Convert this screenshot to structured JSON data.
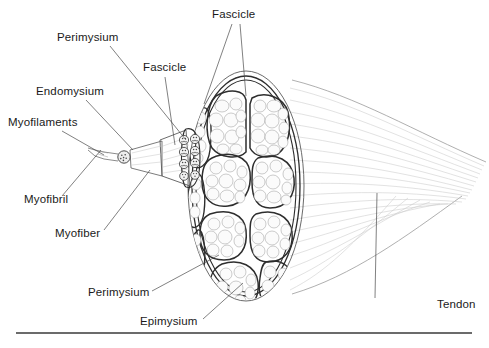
{
  "figure": {
    "width": 489,
    "height": 348,
    "background_color": "#ffffff"
  },
  "labels": [
    {
      "id": "fascicle-top",
      "text": "Fascicle",
      "x": 212,
      "y": 18,
      "anchor": "start"
    },
    {
      "id": "perimysium-top",
      "text": "Perimysium",
      "x": 57,
      "y": 41,
      "anchor": "start"
    },
    {
      "id": "fascicle-mid",
      "text": "Fascicle",
      "x": 143,
      "y": 71,
      "anchor": "start"
    },
    {
      "id": "endomysium",
      "text": "Endomysium",
      "x": 36,
      "y": 95,
      "anchor": "start"
    },
    {
      "id": "myofilaments",
      "text": "Myofilaments",
      "x": 8,
      "y": 126,
      "anchor": "start"
    },
    {
      "id": "myofibril",
      "text": "Myofibril",
      "x": 24,
      "y": 203,
      "anchor": "start"
    },
    {
      "id": "myofiber",
      "text": "Myofiber",
      "x": 55,
      "y": 237,
      "anchor": "start"
    },
    {
      "id": "perimysium-bottom",
      "text": "Perimysium",
      "x": 88,
      "y": 296,
      "anchor": "start"
    },
    {
      "id": "epimysium",
      "text": "Epimysium",
      "x": 140,
      "y": 325,
      "anchor": "start"
    },
    {
      "id": "tendon",
      "text": "Tendon",
      "x": 437,
      "y": 308,
      "anchor": "start"
    }
  ],
  "leader_lines": [
    {
      "id": "leader-fascicle-top-left",
      "points": "232,24 204,104"
    },
    {
      "id": "leader-fascicle-top-right",
      "points": "240,24 246,96"
    },
    {
      "id": "leader-perimysium-top",
      "points": "110,46 186,140"
    },
    {
      "id": "leader-fascicle-mid",
      "points": "165,77 175,145"
    },
    {
      "id": "leader-endomysium",
      "points": "86,100 133,150"
    },
    {
      "id": "leader-myofilaments",
      "points": "62,131 104,155"
    },
    {
      "id": "leader-myofibril",
      "points": "62,196 101,150"
    },
    {
      "id": "leader-myofiber",
      "points": "104,230 150,170"
    },
    {
      "id": "leader-perimysium-bottom",
      "points": "152,291 219,255"
    },
    {
      "id": "leader-epimysium",
      "points": "203,319 243,283"
    },
    {
      "id": "leader-tendon",
      "points": "375,298 377,193"
    }
  ],
  "anatomy": {
    "epimysium_label": "Epimysium",
    "perimysium_label": "Perimysium",
    "endomysium_label": "Endomysium",
    "fascicle_label": "Fascicle",
    "myofiber_label": "Myofiber",
    "myofibril_label": "Myofibril",
    "myofilaments_label": "Myofilaments",
    "tendon_label": "Tendon",
    "fascicle_count": 12,
    "colors": {
      "outline_dark": "#2e2e2e",
      "outline_mid": "#5a5a5a",
      "perimysium_fill": "#c4c4c4",
      "fascicle_fill": "#f4f4f4",
      "cell_fill": "#fbfbfb",
      "tendon_fiber": "#c9c9c9",
      "text": "#1a1a1a"
    }
  },
  "baseline_rule": {
    "x1": 16,
    "x2": 472,
    "y": 333,
    "color": "#3a3a3a"
  }
}
